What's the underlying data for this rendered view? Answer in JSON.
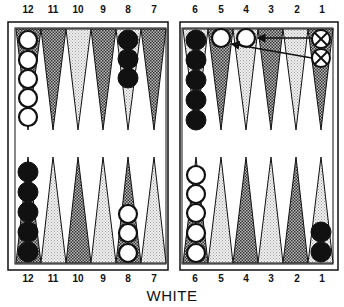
{
  "title": "WHITE",
  "top_labels": [
    "12",
    "11",
    "10",
    "9",
    "8",
    "7",
    "6",
    "5",
    "4",
    "3",
    "2",
    "1"
  ],
  "bottom_labels": [
    "12",
    "11",
    "10",
    "9",
    "8",
    "7",
    "6",
    "5",
    "4",
    "3",
    "2",
    "1"
  ],
  "colors": {
    "line": "#111111",
    "dark_point": "#8a8a8a",
    "light_point": "#d8d8d8",
    "black_checker": "#111111",
    "white_checker": "#ffffff"
  },
  "position": {
    "top": [
      {
        "point": "12",
        "checkers": "white",
        "count": 5
      },
      {
        "point": "8",
        "checkers": "black",
        "count": 3
      },
      {
        "point": "6",
        "checkers": "black",
        "count": 5
      },
      {
        "point": "5",
        "checkers": "white",
        "count": 1
      },
      {
        "point": "4",
        "checkers": "white",
        "count": 1
      },
      {
        "point": "1",
        "checkers": "crossed",
        "count": 2
      }
    ],
    "bottom": [
      {
        "point": "12",
        "checkers": "black",
        "count": 5
      },
      {
        "point": "8",
        "checkers": "white",
        "count": 3
      },
      {
        "point": "6",
        "checkers": "white",
        "count": 5
      },
      {
        "point": "1",
        "checkers": "black",
        "count": 2
      }
    ]
  },
  "moves": [
    "1 to 4 (arrow)",
    "1 to 5 (arrow)"
  ]
}
